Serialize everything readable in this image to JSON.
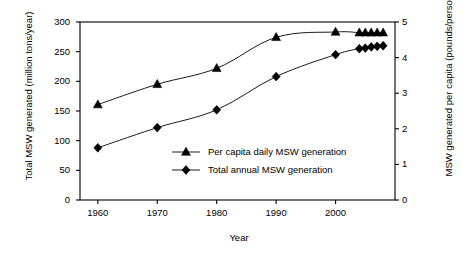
{
  "chart_data": {
    "type": "line",
    "title": "",
    "xlabel": "Year",
    "ylabel": "Total MSW generated (million tons/year)",
    "ylabel_right": "MSW generated per capita (pounds/person/day)",
    "xlim": [
      1957,
      2010
    ],
    "ylim": [
      0,
      300
    ],
    "ylim_right": [
      0,
      5
    ],
    "grid": false,
    "legend_position": "center",
    "x_ticks": [
      "1960",
      "1970",
      "1980",
      "1990",
      "2000"
    ],
    "x_tick_values": [
      1960,
      1970,
      1980,
      1990,
      2000
    ],
    "y_ticks_left": [
      "0",
      "50",
      "100",
      "150",
      "200",
      "250",
      "300"
    ],
    "y_tick_values_left": [
      0,
      50,
      100,
      150,
      200,
      250,
      300
    ],
    "y_ticks_right": [
      "0",
      "1",
      "2",
      "3",
      "4",
      "5"
    ],
    "y_tick_values_right": [
      0,
      1,
      2,
      3,
      4,
      5
    ],
    "series": [
      {
        "name": "Per capita daily MSW generation",
        "axis": "right",
        "marker": "triangle",
        "color": "#000000",
        "x": [
          1960,
          1970,
          1980,
          1990,
          2000,
          2004,
          2005,
          2006,
          2007,
          2008
        ],
        "values": [
          2.68,
          3.25,
          3.7,
          4.57,
          4.72,
          4.7,
          4.7,
          4.7,
          4.7,
          4.7
        ]
      },
      {
        "name": "Total annual MSW generation",
        "axis": "left",
        "marker": "diamond",
        "color": "#000000",
        "x": [
          1960,
          1970,
          1980,
          1990,
          2000,
          2004,
          2005,
          2006,
          2007,
          2008
        ],
        "values": [
          88,
          122,
          152,
          208,
          245,
          255,
          256,
          258,
          259,
          260
        ]
      }
    ],
    "legend": [
      {
        "label": "Per capita daily MSW generation",
        "marker": "triangle"
      },
      {
        "label": "Total annual MSW generation",
        "marker": "diamond"
      }
    ]
  }
}
